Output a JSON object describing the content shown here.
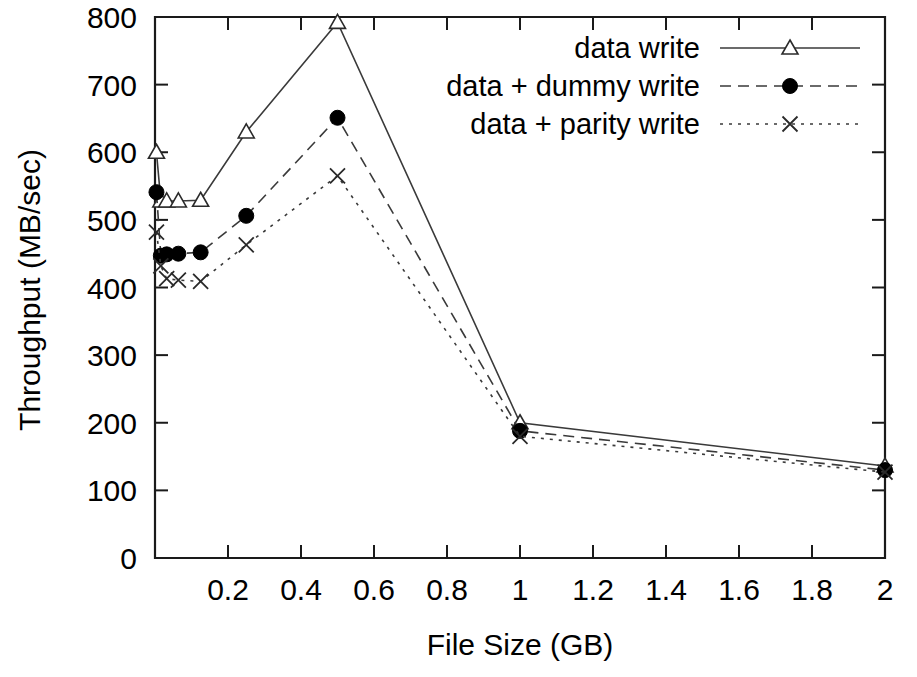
{
  "chart_data": {
    "type": "line",
    "title": "",
    "xlabel": "File Size (GB)",
    "ylabel": "Throughput (MB/sec)",
    "xlim": [
      0,
      2
    ],
    "ylim": [
      0,
      800
    ],
    "grid": false,
    "legend_position": "top-right",
    "x": [
      0.004,
      0.016,
      0.032,
      0.064,
      0.125,
      0.25,
      0.5,
      1,
      2
    ],
    "xticks": [
      0,
      0.2,
      0.4,
      0.6,
      0.8,
      1,
      1.2,
      1.4,
      1.6,
      1.8,
      2
    ],
    "xticklabels": [
      "",
      "0.2",
      "0.4",
      "0.6",
      "0.8",
      "1",
      "1.2",
      "1.4",
      "1.6",
      "1.8",
      "2"
    ],
    "yticks": [
      0,
      100,
      200,
      300,
      400,
      500,
      600,
      700,
      800
    ],
    "yticklabels": [
      "0",
      "100",
      "200",
      "300",
      "400",
      "500",
      "600",
      "700",
      "800"
    ],
    "series": [
      {
        "name": "data write",
        "marker": "triangle-open",
        "linestyle": "solid",
        "values": [
          600,
          528,
          528,
          528,
          529,
          630,
          792,
          200,
          136
        ]
      },
      {
        "name": "data + dummy write",
        "marker": "circle-filled",
        "linestyle": "dashed",
        "values": [
          541,
          447,
          449,
          450,
          452,
          506,
          651,
          188,
          130
        ]
      },
      {
        "name": "data + parity write",
        "marker": "x",
        "linestyle": "dotted",
        "values": [
          482,
          432,
          413,
          411,
          409,
          463,
          565,
          180,
          127
        ]
      }
    ]
  }
}
